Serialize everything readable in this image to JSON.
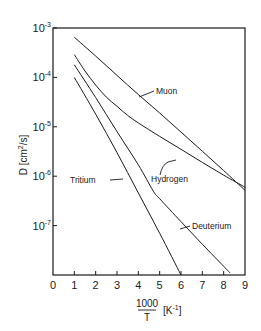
{
  "chart_data": {
    "type": "line",
    "title": "",
    "xlabel": "1000/T [K^-1]",
    "xlabel_numerator": "1000",
    "xlabel_denominator": "T",
    "xlabel_unit": "[K",
    "xlabel_unit_exp": "-1",
    "xlabel_unit_close": "]",
    "ylabel": "D [cm²/s]",
    "yscale": "log",
    "xlim": [
      0,
      9
    ],
    "ylim": [
      1e-08,
      0.001
    ],
    "grid": false,
    "legend": "inline labels with leader arrows",
    "x_ticks": [
      "0",
      "1",
      "2",
      "3",
      "4",
      "5",
      "6",
      "7",
      "8",
      "9"
    ],
    "y_ticks": [
      {
        "base": "10",
        "exp": "-3",
        "value": 0.001
      },
      {
        "base": "10",
        "exp": "-4",
        "value": 0.0001
      },
      {
        "base": "10",
        "exp": "-5",
        "value": 1e-05
      },
      {
        "base": "10",
        "exp": "-6",
        "value": 1e-06
      },
      {
        "base": "10",
        "exp": "-7",
        "value": 1e-07
      }
    ],
    "series": [
      {
        "name": "Muon",
        "x": [
          1,
          2,
          3,
          4,
          5,
          6,
          7,
          8,
          9
        ],
        "y": [
          0.00065,
          0.00027,
          0.00011,
          4.5e-05,
          1.9e-05,
          7.8e-06,
          3.2e-06,
          1.3e-06,
          5.2e-07
        ]
      },
      {
        "name": "Hydrogen",
        "x": [
          1,
          1.5,
          2,
          2.5,
          3,
          3.5,
          4,
          5,
          6,
          7,
          8,
          9
        ],
        "y": [
          0.00029,
          0.000135,
          7e-05,
          4e-05,
          2.6e-05,
          1.7e-05,
          1.2e-05,
          6.4e-06,
          3.5e-06,
          1.9e-06,
          1.05e-06,
          6e-07
        ]
      },
      {
        "name": "Deuterium",
        "x": [
          1,
          2,
          3,
          4,
          4.7,
          5,
          6,
          7,
          8,
          8.3
        ],
        "y": [
          0.00018,
          3.9e-05,
          8e-06,
          1.7e-06,
          5e-07,
          3.5e-07,
          1.2e-07,
          4.2e-08,
          1.5e-08,
          1.1e-08
        ]
      },
      {
        "name": "Tritium",
        "x": [
          1,
          2,
          3,
          4,
          5,
          6
        ],
        "y": [
          0.0001,
          1.8e-05,
          3e-06,
          4.6e-07,
          7e-08,
          1e-08
        ]
      }
    ],
    "annotations": [
      {
        "text": "Muon",
        "near_x": 4.2,
        "near_y": 4e-05
      },
      {
        "text": "Hydrogen",
        "near_x": 5.3,
        "near_y": 6e-06
      },
      {
        "text": "Deuterium",
        "near_x": 5.5,
        "near_y": 2.5e-07
      },
      {
        "text": "Tritium",
        "near_x": 3.0,
        "near_y": 1.3e-06
      }
    ]
  },
  "labels": {
    "muon": "Muon",
    "hydrogen": "Hydrogen",
    "deuterium": "Deuterium",
    "tritium": "Tritium",
    "y_axis": "D [cm",
    "y_axis_sup": "2",
    "y_axis_tail": "/s]"
  }
}
